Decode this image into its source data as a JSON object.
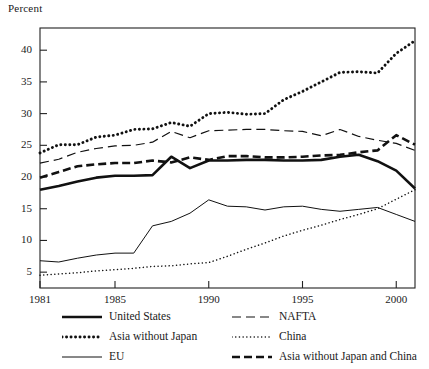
{
  "chart_data": {
    "type": "line",
    "title": "",
    "ylabel": "Percent",
    "xlabel": "",
    "grid": false,
    "legend_position": "bottom",
    "xlim": [
      1981,
      2001
    ],
    "ylim": [
      2.5,
      43.5
    ],
    "yticks": [
      5,
      10,
      15,
      20,
      25,
      30,
      35,
      40
    ],
    "xticks": [
      1981,
      1985,
      1990,
      1995,
      2000
    ],
    "xtick_labels": [
      "1981",
      "1985",
      "1990",
      "1995",
      "2000"
    ],
    "x": [
      1981,
      1982,
      1983,
      1984,
      1985,
      1986,
      1987,
      1988,
      1989,
      1990,
      1991,
      1992,
      1993,
      1994,
      1995,
      1996,
      1997,
      1998,
      1999,
      2000,
      2001
    ],
    "series": [
      {
        "name": "United States",
        "style": "solid-thick",
        "values": [
          18.0,
          18.6,
          19.3,
          19.9,
          20.2,
          20.2,
          20.3,
          23.2,
          21.4,
          22.6,
          22.6,
          22.7,
          22.7,
          22.6,
          22.6,
          22.7,
          23.2,
          23.5,
          22.5,
          21.0,
          18.2
        ]
      },
      {
        "name": "NAFTA",
        "style": "dashed-thin",
        "values": [
          22.2,
          22.8,
          23.9,
          24.5,
          24.9,
          25.0,
          25.5,
          27.2,
          26.2,
          27.3,
          27.4,
          27.5,
          27.5,
          27.3,
          27.2,
          26.5,
          27.5,
          26.4,
          25.8,
          25.3,
          24.2
        ]
      },
      {
        "name": "Asia without Japan",
        "style": "dotted-thick",
        "values": [
          23.8,
          25.1,
          25.1,
          26.3,
          26.6,
          27.5,
          27.6,
          28.6,
          28.0,
          30.0,
          30.2,
          29.9,
          30.0,
          32.2,
          33.5,
          35.0,
          36.5,
          36.6,
          36.4,
          39.5,
          41.5
        ]
      },
      {
        "name": "China",
        "style": "dotted-thin",
        "values": [
          4.5,
          4.7,
          4.9,
          5.2,
          5.4,
          5.6,
          5.9,
          6.0,
          6.3,
          6.5,
          7.5,
          8.6,
          9.6,
          10.7,
          11.6,
          12.4,
          13.3,
          14.1,
          15.0,
          16.5,
          18.0
        ]
      },
      {
        "name": "EU",
        "style": "solid-thin",
        "values": [
          6.8,
          6.6,
          7.2,
          7.7,
          8.0,
          8.0,
          12.3,
          13.0,
          14.3,
          16.4,
          15.4,
          15.3,
          14.8,
          15.3,
          15.4,
          14.9,
          14.6,
          14.9,
          15.2,
          14.1,
          13.0
        ]
      },
      {
        "name": "Asia without Japan and China",
        "style": "dashed-thick",
        "values": [
          19.9,
          20.8,
          21.7,
          22.0,
          22.2,
          22.2,
          22.6,
          22.3,
          23.1,
          22.7,
          23.3,
          23.3,
          23.1,
          23.1,
          23.2,
          23.4,
          23.5,
          23.9,
          24.2,
          26.6,
          25.1
        ]
      }
    ]
  },
  "legend": {
    "items": [
      {
        "label": "United States",
        "style": "solid-thick"
      },
      {
        "label": "NAFTA",
        "style": "dashed-thin"
      },
      {
        "label": "Asia without Japan",
        "style": "dotted-thick"
      },
      {
        "label": "China",
        "style": "dotted-thin"
      },
      {
        "label": "EU",
        "style": "solid-thin"
      },
      {
        "label": "Asia without Japan and China",
        "style": "dashed-thick"
      }
    ]
  },
  "colors": {
    "ink": "#111111",
    "background": "#ffffff",
    "axis": "#222222"
  }
}
